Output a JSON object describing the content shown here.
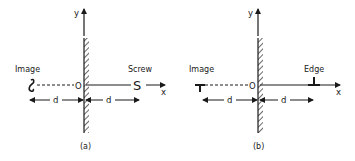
{
  "panels": [
    {
      "id": "a",
      "caption": "(a)",
      "y_axis_label": "y",
      "x_axis_label": "x",
      "origin_label": "O",
      "left_label": "Image",
      "right_label": "Screw",
      "right_object_glyph": "S",
      "image_object_glyph": "Ϩ",
      "left_distance_label": "d",
      "right_distance_label": "d"
    },
    {
      "id": "b",
      "caption": "(b)",
      "y_axis_label": "y",
      "x_axis_label": "x",
      "origin_label": "O",
      "left_label": "Image",
      "right_label": "Edge",
      "right_object_glyph": "⊥",
      "image_object_glyph": "T",
      "left_distance_label": "d",
      "right_distance_label": "d"
    }
  ],
  "colors": {
    "ink": "#1a1a1a",
    "background": "#ffffff"
  }
}
